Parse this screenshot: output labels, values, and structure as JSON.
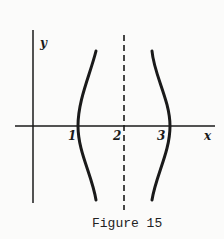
{
  "figure": {
    "caption": "Figure 15",
    "axes": {
      "x_label": "x",
      "y_label": "y"
    },
    "tick_labels": [
      "1",
      "2",
      "3"
    ],
    "asymptote": {
      "x": 2,
      "style": "dashed"
    },
    "curves": [
      {
        "name": "left-branch",
        "x_intercept": 1,
        "opens": "left"
      },
      {
        "name": "right-branch",
        "x_intercept": 3,
        "opens": "right"
      }
    ],
    "colors": {
      "ink": "#1a1a1a",
      "background": "#fbfbfa"
    }
  }
}
